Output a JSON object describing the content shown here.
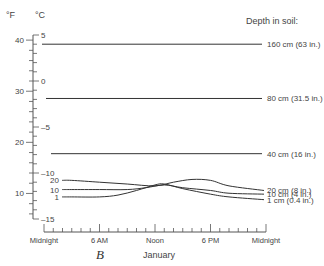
{
  "chart_data": {
    "type": "line",
    "title": "",
    "xlabel": "January",
    "panel_label": "B",
    "legend_title": "Depth in soil:",
    "y_units": {
      "left": "°F",
      "right": "°C"
    },
    "x_ticks": [
      "Midnight",
      "6 AM",
      "Noon",
      "6 PM",
      "Midnight"
    ],
    "x_hours": [
      0,
      6,
      12,
      18,
      24
    ],
    "celsius_ticks": [
      5,
      0,
      -5,
      -10,
      -15
    ],
    "celsius_tick_labels": [
      "5",
      "0",
      "-5",
      "-10",
      "-15"
    ],
    "fahrenheit_ticks": [
      40,
      30,
      20,
      10
    ],
    "fahrenheit_tick_labels": [
      "40",
      "30",
      "20",
      "10"
    ],
    "ylim_celsius": [
      -15,
      5
    ],
    "series": [
      {
        "name": "160 cm (63 in.)",
        "x": [
          0,
          24
        ],
        "values_celsius": [
          4.0,
          4.0
        ]
      },
      {
        "name": "80 cm (31.5 in.)",
        "x": [
          0,
          24
        ],
        "values_celsius": [
          -1.9,
          -1.9
        ]
      },
      {
        "name": "40 cm (16 in.)",
        "x": [
          0,
          24
        ],
        "values_celsius": [
          -7.9,
          -7.9
        ]
      },
      {
        "name": "20 cm (8 in.)",
        "x": [
          0,
          3,
          6,
          9,
          12,
          14,
          16,
          18,
          20,
          23
        ],
        "values_celsius": [
          -10.8,
          -10.8,
          -11.0,
          -11.2,
          -11.4,
          -11.0,
          -10.7,
          -10.8,
          -11.4,
          -11.9
        ]
      },
      {
        "name": "10 cm (4 in.)",
        "x": [
          0,
          3,
          6,
          9,
          11,
          13,
          15,
          18,
          20,
          23
        ],
        "values_celsius": [
          -11.8,
          -11.8,
          -11.8,
          -11.8,
          -11.6,
          -11.3,
          -11.6,
          -11.9,
          -12.2,
          -12.3
        ]
      },
      {
        "name": "1 cm (0.4 in.)",
        "x": [
          0,
          3,
          6,
          8,
          10,
          12,
          13,
          15,
          18,
          20,
          23
        ],
        "values_celsius": [
          -12.6,
          -12.6,
          -12.6,
          -12.4,
          -11.9,
          -11.3,
          -11.2,
          -11.7,
          -12.3,
          -12.6,
          -12.9
        ]
      }
    ],
    "left_series_labels": [
      "20",
      "10",
      "1"
    ],
    "grid": false,
    "legend_position": "right"
  }
}
